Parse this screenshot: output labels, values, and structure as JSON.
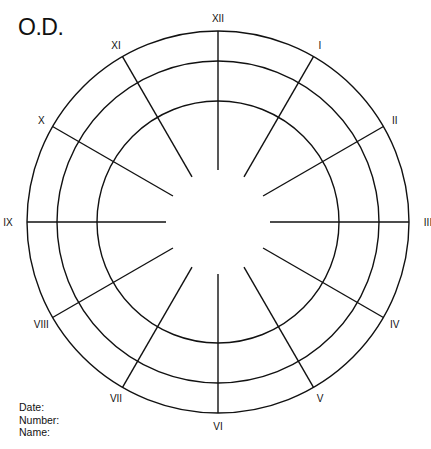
{
  "title": "O.D.",
  "chart": {
    "center": [
      218,
      222
    ],
    "rings": [
      191,
      161,
      121
    ],
    "spoke_inner_radius": 52,
    "spoke_outer_radius": 191,
    "label_radius": 204,
    "stroke_color": "#111111",
    "hours": [
      "XII",
      "I",
      "II",
      "III",
      "IV",
      "V",
      "VI",
      "VII",
      "VIII",
      "IX",
      "X",
      "XI"
    ]
  },
  "footer": {
    "date_label": "Date:",
    "number_label": "Number:",
    "name_label": "Name:"
  }
}
